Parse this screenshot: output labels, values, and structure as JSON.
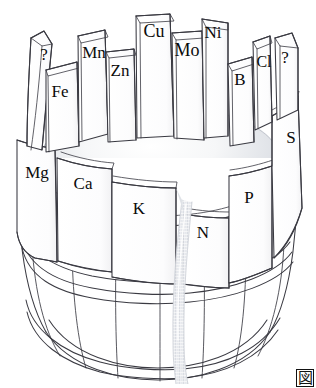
{
  "figure": {
    "corner_mark": "図",
    "colors": {
      "outline": "#3a3a42",
      "stave_fill": "#fdfdfd",
      "stave_top_fill": "#f2f2f4",
      "water_edge": "#c9ccd4",
      "water_center": "#fbfbfc",
      "stream": "#e3e5ea",
      "background": "#ffffff"
    },
    "staves": [
      {
        "id": "q-left",
        "label": "?",
        "x": 44,
        "y": 60,
        "size": 17,
        "anchor": "middle"
      },
      {
        "id": "fe",
        "label": "Fe",
        "x": 60,
        "y": 97,
        "size": 17,
        "anchor": "middle"
      },
      {
        "id": "mn",
        "label": "Mn",
        "x": 94,
        "y": 58,
        "size": 17,
        "anchor": "middle"
      },
      {
        "id": "zn",
        "label": "Zn",
        "x": 120,
        "y": 76,
        "size": 17,
        "anchor": "middle"
      },
      {
        "id": "cu",
        "label": "Cu",
        "x": 154,
        "y": 37,
        "size": 18,
        "anchor": "middle"
      },
      {
        "id": "mo",
        "label": "Mo",
        "x": 187,
        "y": 56,
        "size": 18,
        "anchor": "middle"
      },
      {
        "id": "ni",
        "label": "Ni",
        "x": 213,
        "y": 38,
        "size": 17,
        "anchor": "middle"
      },
      {
        "id": "b",
        "label": "B",
        "x": 240,
        "y": 85,
        "size": 17,
        "anchor": "middle"
      },
      {
        "id": "cl",
        "label": "Cl",
        "x": 264,
        "y": 67,
        "size": 16,
        "anchor": "middle"
      },
      {
        "id": "q-right",
        "label": "?",
        "x": 285,
        "y": 63,
        "size": 17,
        "anchor": "middle"
      },
      {
        "id": "s",
        "label": "S",
        "x": 291,
        "y": 143,
        "size": 17,
        "anchor": "middle"
      },
      {
        "id": "mg",
        "label": "Mg",
        "x": 37,
        "y": 178,
        "size": 17,
        "anchor": "middle"
      },
      {
        "id": "ca",
        "label": "Ca",
        "x": 83,
        "y": 189,
        "size": 17,
        "anchor": "middle"
      },
      {
        "id": "k",
        "label": "K",
        "x": 139,
        "y": 214,
        "size": 17,
        "anchor": "middle"
      },
      {
        "id": "p",
        "label": "P",
        "x": 249,
        "y": 203,
        "size": 17,
        "anchor": "middle"
      },
      {
        "id": "n",
        "label": "N",
        "x": 203,
        "y": 238,
        "size": 17,
        "anchor": "middle"
      }
    ],
    "limiting_element": "N",
    "stream": {
      "from_x": 180,
      "to_x": 176,
      "top_y": 198,
      "bottom_y": 384
    }
  }
}
